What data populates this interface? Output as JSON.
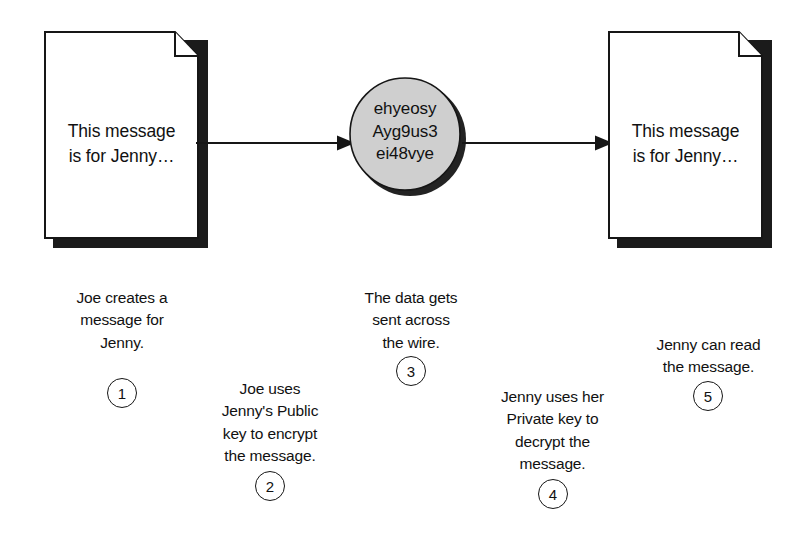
{
  "diagram": {
    "colors": {
      "ink": "#111111",
      "outline": "#161616",
      "shadow": "#1b1b1b",
      "cipher_fill": "#cfcfcf",
      "background": "#ffffff"
    },
    "documents": [
      {
        "name": "plaintext-document-sender",
        "text": "This message\nis for Jenny…"
      },
      {
        "name": "plaintext-document-recipient",
        "text": "This message\nis for Jenny…"
      }
    ],
    "cipher": {
      "name": "ciphertext-blob",
      "text": "ehyeosy\nAyg9us3\nei48vye"
    },
    "arrows": [
      {
        "name": "arrow-document-to-cipher",
        "direction": "right"
      },
      {
        "name": "arrow-cipher-to-document",
        "direction": "right"
      }
    ],
    "steps": [
      {
        "number": "1",
        "text": "Joe creates a\nmessage for\nJenny."
      },
      {
        "number": "2",
        "text": "Joe uses\nJenny's Public\nkey to encrypt\nthe message."
      },
      {
        "number": "3",
        "text": "The data gets\nsent across\nthe wire."
      },
      {
        "number": "4",
        "text": "Jenny uses her\nPrivate key to\ndecrypt the\nmessage."
      },
      {
        "number": "5",
        "text": "Jenny can read\nthe message."
      }
    ]
  }
}
